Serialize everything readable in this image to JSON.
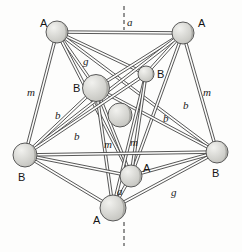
{
  "figure": {
    "kind": "ball-and-stick crystal structure diagram",
    "background_color": "#fdfdfc",
    "bond_color": "#3a3a3a",
    "sphere_fill": "#d8d8d4",
    "sphere_stroke": "#4a4a4a",
    "sphere_shade": "#b3b3ae",
    "axis_line_style": "dashed vertical"
  },
  "atoms": [
    {
      "id": "A1",
      "label": "A",
      "x": 57,
      "y": 32,
      "r": 11,
      "label_x": 40,
      "label_y": 18
    },
    {
      "id": "A2",
      "label": "A",
      "x": 183,
      "y": 33,
      "r": 11,
      "label_x": 198,
      "label_y": 18
    },
    {
      "id": "B1",
      "label": "B",
      "x": 96,
      "y": 88,
      "r": 13.5,
      "label_x": 73,
      "label_y": 83
    },
    {
      "id": "B2",
      "label": "B",
      "x": 146,
      "y": 74,
      "r": 8,
      "label_x": 157,
      "label_y": 69
    },
    {
      "id": "C1",
      "label": "",
      "x": 120,
      "y": 115,
      "r": 12,
      "label_x": 0,
      "label_y": 0
    },
    {
      "id": "B3",
      "label": "B",
      "x": 25,
      "y": 155,
      "r": 12,
      "label_x": 18,
      "label_y": 172
    },
    {
      "id": "B4",
      "label": "B",
      "x": 217,
      "y": 152,
      "r": 11,
      "label_x": 212,
      "label_y": 168
    },
    {
      "id": "A3",
      "label": "A",
      "x": 131,
      "y": 176,
      "r": 11,
      "label_x": 143,
      "label_y": 163
    },
    {
      "id": "A4",
      "label": "A",
      "x": 113,
      "y": 208,
      "r": 13,
      "label_x": 93,
      "label_y": 215
    }
  ],
  "bond_labels": [
    {
      "text": "a",
      "x": 127,
      "y": 17
    },
    {
      "text": "g",
      "x": 83,
      "y": 56
    },
    {
      "text": "m",
      "x": 27,
      "y": 87
    },
    {
      "text": "m",
      "x": 203,
      "y": 87
    },
    {
      "text": "b",
      "x": 55,
      "y": 110
    },
    {
      "text": "b",
      "x": 74,
      "y": 131
    },
    {
      "text": "b",
      "x": 183,
      "y": 100
    },
    {
      "text": "b",
      "x": 163,
      "y": 113
    },
    {
      "text": "m",
      "x": 104,
      "y": 139
    },
    {
      "text": "m",
      "x": 130,
      "y": 137
    },
    {
      "text": "a",
      "x": 117,
      "y": 186
    },
    {
      "text": "g",
      "x": 171,
      "y": 187
    }
  ],
  "bonds": [
    {
      "from": "A1",
      "to": "A2",
      "name": "a"
    },
    {
      "from": "A1",
      "to": "B1",
      "name": "g"
    },
    {
      "from": "A1",
      "to": "B2",
      "name": ""
    },
    {
      "from": "A1",
      "to": "B3",
      "name": "m"
    },
    {
      "from": "A1",
      "to": "B4",
      "name": ""
    },
    {
      "from": "A1",
      "to": "A3",
      "name": ""
    },
    {
      "from": "A2",
      "to": "B1",
      "name": ""
    },
    {
      "from": "A2",
      "to": "B2",
      "name": ""
    },
    {
      "from": "A2",
      "to": "B4",
      "name": "m"
    },
    {
      "from": "A2",
      "to": "B3",
      "name": ""
    },
    {
      "from": "A2",
      "to": "A3",
      "name": "b"
    },
    {
      "from": "B1",
      "to": "B3",
      "name": "b"
    },
    {
      "from": "B1",
      "to": "B4",
      "name": "b"
    },
    {
      "from": "B1",
      "to": "A4",
      "name": "m"
    },
    {
      "from": "B1",
      "to": "A3",
      "name": ""
    },
    {
      "from": "B2",
      "to": "B3",
      "name": "b"
    },
    {
      "from": "B2",
      "to": "A4",
      "name": "m"
    },
    {
      "from": "B2",
      "to": "A3",
      "name": "m"
    },
    {
      "from": "B3",
      "to": "B4",
      "name": ""
    },
    {
      "from": "B3",
      "to": "A4",
      "name": ""
    },
    {
      "from": "B3",
      "to": "A3",
      "name": ""
    },
    {
      "from": "B4",
      "to": "A4",
      "name": "g"
    },
    {
      "from": "B4",
      "to": "A3",
      "name": ""
    },
    {
      "from": "A3",
      "to": "A4",
      "name": "a"
    }
  ],
  "axis": {
    "x": 124,
    "top_y1": 6,
    "top_y2": 30,
    "bottom_y1": 222,
    "bottom_y2": 246
  }
}
